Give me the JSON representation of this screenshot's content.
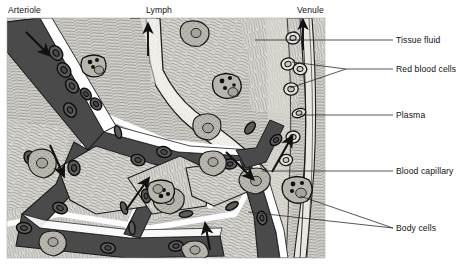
{
  "figure": {
    "panel": {
      "x": 7,
      "y": 18,
      "width": 318,
      "height": 240
    },
    "colors": {
      "tissue_background": "#d6d4cf",
      "vessel_dark": "#4a4a4a",
      "vessel_light": "#e9e7e2",
      "lymph_fluid": "#efeee9",
      "outline": "#1c1c1c",
      "vessel_wall_white": "#ffffff",
      "label_text": "#111111",
      "leader_line": "#2b2b2b",
      "body_cell_fill": "#b8b5ae",
      "granule": "#111111"
    }
  },
  "top_labels": [
    {
      "name": "arteriole",
      "text": "Arteriole",
      "x": 8,
      "y": 13,
      "anchor": "start"
    },
    {
      "name": "lymph",
      "text": "Lymph",
      "x": 146,
      "y": 13,
      "anchor": "start"
    },
    {
      "name": "venule",
      "text": "Venule",
      "x": 297,
      "y": 13,
      "anchor": "start"
    }
  ],
  "side_labels": [
    {
      "name": "tissue-fluid",
      "text": "Tissue fluid",
      "x": 396,
      "y": 43
    },
    {
      "name": "red-blood-cells",
      "text": "Red blood cells",
      "x": 396,
      "y": 72
    },
    {
      "name": "plasma",
      "text": "Plasma",
      "x": 396,
      "y": 118
    },
    {
      "name": "blood-capillary",
      "text": "Blood capillary",
      "x": 396,
      "y": 174
    },
    {
      "name": "body-cells",
      "text": "Body cells",
      "x": 396,
      "y": 231
    }
  ],
  "flow_arrows": [
    {
      "name": "arteriole-inflow-arrow",
      "direction": "down-right",
      "description": "blood entering arteriole"
    },
    {
      "name": "lymph-outflow-arrow",
      "direction": "up",
      "description": "lymph draining away"
    },
    {
      "name": "venule-outflow-arrow",
      "direction": "up",
      "description": "blood leaving venule"
    },
    {
      "name": "tissue-fluid-arrow-left",
      "direction": "down-right",
      "description": "fluid leaving capillary into tissue"
    },
    {
      "name": "tissue-fluid-arrow-center",
      "direction": "up-right",
      "description": "fluid returning toward capillary"
    },
    {
      "name": "tissue-fluid-arrow-lymph",
      "direction": "down-right",
      "description": "fluid entering lymph vessel"
    },
    {
      "name": "venule-return-arrow",
      "direction": "up-right",
      "description": "fluid returning to venule"
    },
    {
      "name": "capillary-bottom-arrow",
      "direction": "up",
      "description": "blood flow toward venule"
    }
  ],
  "features": {
    "red_blood_cell_count_arteriole": 9,
    "red_blood_cell_count_venule": 7,
    "white_blood_cell_count": 4,
    "body_cell_count": 8
  }
}
